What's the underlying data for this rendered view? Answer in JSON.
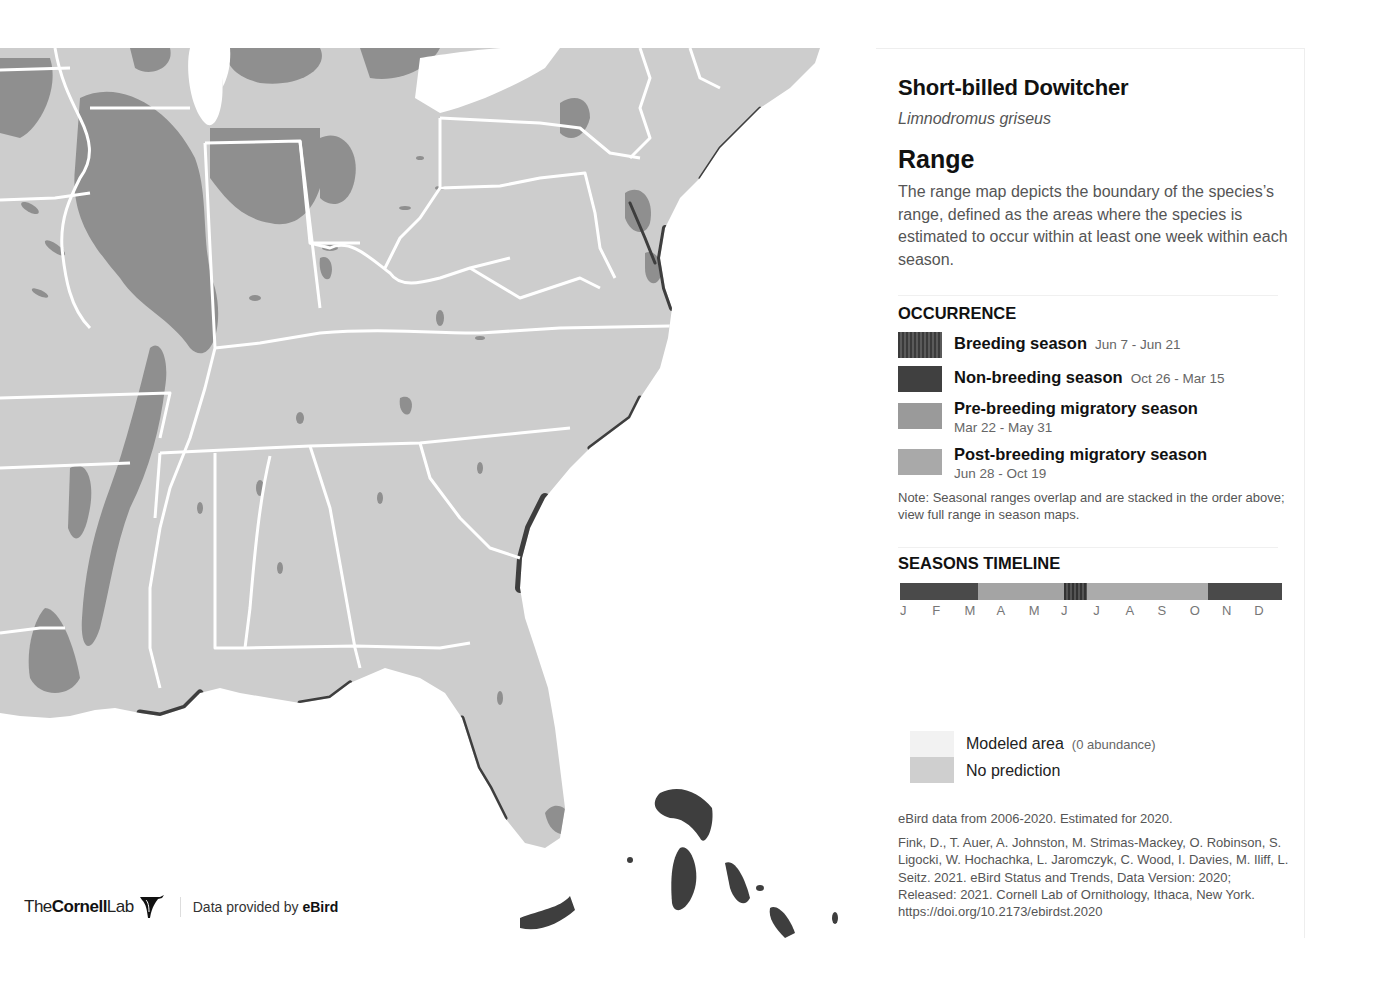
{
  "species": {
    "common_name": "Short-billed Dowitcher",
    "scientific_name": "Limnodromus griseus"
  },
  "range": {
    "title": "Range",
    "description": "The range map depicts the boundary of the species’s range, defined as the areas where the species is estimated to occur within at least one week within each season."
  },
  "occurrence": {
    "heading": "OCCURRENCE",
    "items": [
      {
        "label": "Breeding season",
        "dates": "Jun 7 - Jun 21",
        "color": "#4a4a4a",
        "pattern": "striped"
      },
      {
        "label": "Non-breeding season",
        "dates": "Oct 26 - Mar 15",
        "color": "#404040",
        "pattern": "solid"
      },
      {
        "label": "Pre-breeding migratory season",
        "dates": "Mar 22 - May 31",
        "color": "#9a9a9a",
        "pattern": "solid"
      },
      {
        "label": "Post-breeding migratory season",
        "dates": "Jun 28 - Oct 19",
        "color": "#a9a9a9",
        "pattern": "solid"
      }
    ],
    "note": "Note: Seasonal ranges overlap and are stacked in the order above; view full range in season maps."
  },
  "timeline": {
    "heading": "SEASONS TIMELINE",
    "months": [
      "J",
      "F",
      "M",
      "A",
      "M",
      "J",
      "J",
      "A",
      "S",
      "O",
      "N",
      "D"
    ],
    "segments": [
      {
        "season": "non-breeding",
        "start_frac": 0.0,
        "end_frac": 0.205,
        "color": "#4a4a4a"
      },
      {
        "season": "pre-breeding",
        "start_frac": 0.205,
        "end_frac": 0.43,
        "color": "#a4a4a4"
      },
      {
        "season": "breeding",
        "start_frac": 0.43,
        "end_frac": 0.49,
        "color": "#3e3e3e"
      },
      {
        "season": "post-breeding",
        "start_frac": 0.49,
        "end_frac": 0.807,
        "color": "#ababab"
      },
      {
        "season": "non-breeding",
        "start_frac": 0.807,
        "end_frac": 1.0,
        "color": "#4a4a4a"
      }
    ]
  },
  "legend2": {
    "items": [
      {
        "label": "Modeled area",
        "sub": "(0 abundance)",
        "color": "#f2f2f2"
      },
      {
        "label": "No prediction",
        "sub": "",
        "color": "#cfcfcf"
      }
    ]
  },
  "source": {
    "data_from": "eBird data from 2006-2020. Estimated for 2020.",
    "citation": "Fink, D., T. Auer, A. Johnston, M. Strimas-Mackey, O. Robinson, S. Ligocki, W. Hochachka, L. Jaromczyk, C. Wood, I. Davies, M. Iliff, L. Seitz. 2021. eBird Status and Trends, Data Version: 2020; Released: 2021. Cornell Lab of Ornithology, Ithaca, New York. https://doi.org/10.2173/ebirdst.2020"
  },
  "footer": {
    "logo_the": "The",
    "logo_cornell": "Cornell",
    "logo_lab": "Lab",
    "provided_prefix": "Data provided by ",
    "provided_brand": "eBird"
  },
  "map": {
    "region": "Eastern United States",
    "colors": {
      "land": "#cdcdcd",
      "water": "#ffffff",
      "borders": "#ffffff",
      "pre_breeding": "#8f8f8f",
      "non_breeding": "#3e3e3e",
      "post_breeding": "#a8a8a8"
    }
  }
}
